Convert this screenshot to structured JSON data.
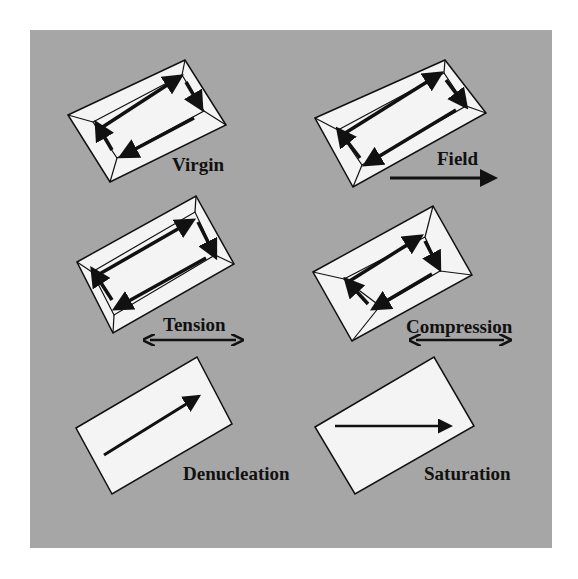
{
  "figure": {
    "background_color": "#a6a6a6",
    "panel_color": "#f4f4f4",
    "panels": [
      {
        "id": "virgin",
        "label": "Virgin",
        "state": "closure domain structure, rotated rectangle"
      },
      {
        "id": "field",
        "label": "Field",
        "state": "closure domains with applied field arrow to the right"
      },
      {
        "id": "tension",
        "label": "Tension",
        "state": "closure domains with double-headed horizontal arrow"
      },
      {
        "id": "compression",
        "label": "Compression",
        "state": "closure domains with double-headed horizontal arrow"
      },
      {
        "id": "denucleation",
        "label": "Denucleation",
        "state": "single domain, diagonal arrow"
      },
      {
        "id": "saturation",
        "label": "Saturation",
        "state": "single domain, horizontal arrow"
      }
    ],
    "annotations": {
      "field_arrow": "single-headed arrow pointing right",
      "tension_arrow": "double-headed arrow",
      "compression_arrow": "double-headed arrow"
    }
  }
}
